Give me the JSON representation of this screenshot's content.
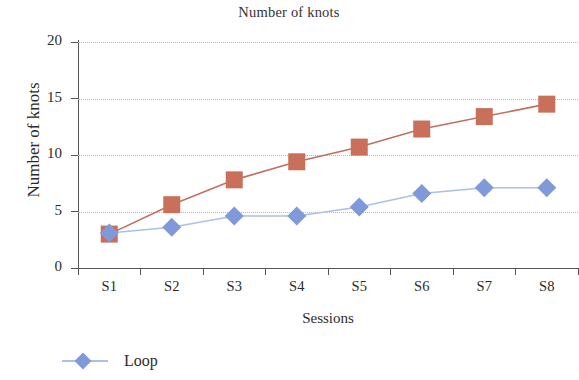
{
  "chart_data": {
    "type": "line",
    "title": "Number of knots",
    "xlabel": "Sessions",
    "ylabel": "Number of knots",
    "categories": [
      "S1",
      "S2",
      "S3",
      "S4",
      "S5",
      "S6",
      "S7",
      "S8"
    ],
    "ylim": [
      0,
      20
    ],
    "yticks": [
      0,
      5,
      10,
      15,
      20
    ],
    "grid": true,
    "legend_position": "bottom-left",
    "series": [
      {
        "name": "",
        "marker": "square",
        "color": "#c9705a",
        "line_color": "#c2705e",
        "values": [
          3.0,
          5.6,
          7.8,
          9.4,
          10.7,
          12.3,
          13.4,
          14.5
        ]
      },
      {
        "name": "Loop",
        "marker": "diamond",
        "color": "#8099d9",
        "line_color": "#a9c0e8",
        "values": [
          3.1,
          3.6,
          4.6,
          4.6,
          5.4,
          6.6,
          7.1,
          7.1
        ]
      }
    ]
  },
  "legend": {
    "entries": [
      {
        "label": "Loop",
        "color": "#8099d9",
        "line_color": "#a9c0e8"
      }
    ]
  },
  "axis": {
    "y_tick_labels": [
      "20",
      "15",
      "10",
      "5",
      "0"
    ],
    "x_tick_labels": [
      "S1",
      "S2",
      "S3",
      "S4",
      "S5",
      "S6",
      "S7",
      "S8"
    ]
  }
}
